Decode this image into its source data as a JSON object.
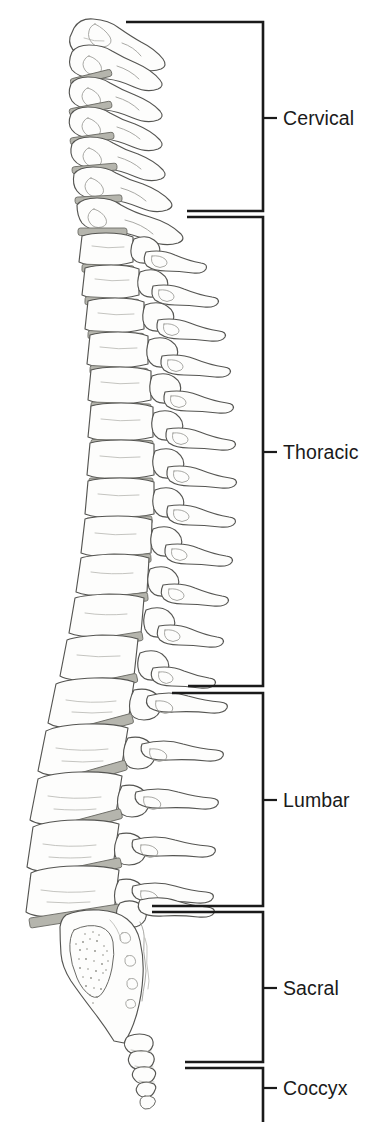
{
  "figure": {
    "view": "lateral",
    "background_color": "#ffffff",
    "line_color": "#3a3a3a",
    "bone_fill": "#fdfdfc",
    "disc_color": "#b5b5ad",
    "bracket_color": "#1a1a1a",
    "label_color": "#1a1a1a"
  },
  "brackets": {
    "spine_x": 263,
    "tick_length": 14,
    "label_x": 283,
    "regions": [
      {
        "id": "cervical",
        "label": "Cervical",
        "top_y": 22,
        "bottom_y": 211,
        "tick_y": 118,
        "arm_left_top_x": 126,
        "arm_left_bottom_x": 187,
        "vertebra_count": 7
      },
      {
        "id": "thoracic",
        "label": "Thoracic",
        "top_y": 217,
        "bottom_y": 686,
        "tick_y": 452,
        "arm_left_top_x": 187,
        "arm_left_bottom_x": 188,
        "vertebra_count": 12
      },
      {
        "id": "lumbar",
        "label": "Lumbar",
        "top_y": 693,
        "bottom_y": 906,
        "tick_y": 800,
        "arm_left_top_x": 172,
        "arm_left_bottom_x": 152,
        "vertebra_count": 5
      },
      {
        "id": "sacral",
        "label": "Sacral",
        "top_y": 912,
        "bottom_y": 1062,
        "tick_y": 988,
        "arm_left_top_x": 152,
        "arm_left_bottom_x": 185,
        "vertebra_count": 5
      },
      {
        "id": "coccyx",
        "label": "Coccyx",
        "top_y": 1068,
        "bottom_y": 1122,
        "tick_y": 1088,
        "arm_left_top_x": 185,
        "arm_left_bottom_x": 185,
        "vertebra_count": 4
      }
    ]
  },
  "spine": {
    "cervical_vertebrae": [
      {
        "cx": 100,
        "cy": 40,
        "w": 46,
        "h": 30,
        "rot": -24,
        "sp_len": 62,
        "sp_angle": 12
      },
      {
        "cx": 97,
        "cy": 72,
        "w": 44,
        "h": 26,
        "rot": -20,
        "sp_len": 66,
        "sp_angle": 16
      },
      {
        "cx": 95,
        "cy": 101,
        "w": 44,
        "h": 25,
        "rot": -16,
        "sp_len": 68,
        "sp_angle": 16
      },
      {
        "cx": 95,
        "cy": 129,
        "w": 45,
        "h": 25,
        "rot": -12,
        "sp_len": 66,
        "sp_angle": 14
      },
      {
        "cx": 97,
        "cy": 157,
        "w": 46,
        "h": 25,
        "rot": -8,
        "sp_len": 68,
        "sp_angle": 12
      },
      {
        "cx": 101,
        "cy": 185,
        "w": 48,
        "h": 26,
        "rot": -4,
        "sp_len": 76,
        "sp_angle": 10
      },
      {
        "cx": 107,
        "cy": 214,
        "w": 50,
        "h": 27,
        "rot": 0,
        "sp_len": 82,
        "sp_angle": 10
      }
    ],
    "thoracic_vertebrae": [
      {
        "cx": 113,
        "cy": 245,
        "w": 52,
        "h": 29,
        "rot": 3,
        "sp_len": 86,
        "sp_angle": 22
      },
      {
        "cx": 117,
        "cy": 277,
        "w": 54,
        "h": 30,
        "rot": 5,
        "sp_len": 90,
        "sp_angle": 25
      },
      {
        "cx": 121,
        "cy": 310,
        "w": 56,
        "h": 31,
        "rot": 6,
        "sp_len": 92,
        "sp_angle": 27
      },
      {
        "cx": 124,
        "cy": 344,
        "w": 58,
        "h": 32,
        "rot": 6,
        "sp_len": 92,
        "sp_angle": 28
      },
      {
        "cx": 126,
        "cy": 379,
        "w": 60,
        "h": 33,
        "rot": 5,
        "sp_len": 94,
        "sp_angle": 29
      },
      {
        "cx": 127,
        "cy": 414,
        "w": 62,
        "h": 34,
        "rot": 3,
        "sp_len": 96,
        "sp_angle": 30
      },
      {
        "cx": 126,
        "cy": 450,
        "w": 64,
        "h": 35,
        "rot": 1,
        "sp_len": 96,
        "sp_angle": 30
      },
      {
        "cx": 124,
        "cy": 487,
        "w": 66,
        "h": 36,
        "rot": -2,
        "sp_len": 94,
        "sp_angle": 29
      },
      {
        "cx": 120,
        "cy": 524,
        "w": 68,
        "h": 37,
        "rot": -5,
        "sp_len": 92,
        "sp_angle": 27
      },
      {
        "cx": 115,
        "cy": 562,
        "w": 70,
        "h": 38,
        "rot": -8,
        "sp_len": 90,
        "sp_angle": 24
      },
      {
        "cx": 108,
        "cy": 601,
        "w": 72,
        "h": 39,
        "rot": -11,
        "sp_len": 88,
        "sp_angle": 20
      },
      {
        "cx": 100,
        "cy": 641,
        "w": 76,
        "h": 41,
        "rot": -14,
        "sp_len": 86,
        "sp_angle": 14
      }
    ],
    "lumbar_vertebrae": [
      {
        "cx": 90,
        "cy": 686,
        "w": 84,
        "h": 45,
        "rot": -17,
        "sp_len": 92,
        "sp_angle": 4
      },
      {
        "cx": 81,
        "cy": 733,
        "w": 88,
        "h": 46,
        "rot": -18,
        "sp_len": 94,
        "sp_angle": 2
      },
      {
        "cx": 74,
        "cy": 781,
        "w": 90,
        "h": 46,
        "rot": -17,
        "sp_len": 94,
        "sp_angle": 0
      },
      {
        "cx": 70,
        "cy": 828,
        "w": 92,
        "h": 45,
        "rot": -14,
        "sp_len": 92,
        "sp_angle": -2
      },
      {
        "cx": 70,
        "cy": 874,
        "w": 94,
        "h": 44,
        "rot": -10,
        "sp_len": 90,
        "sp_angle": -5
      }
    ],
    "sacrum": {
      "top_x": 78,
      "top_y": 915,
      "bottom_x": 150,
      "bottom_y": 1042,
      "width": 78,
      "has_stipple": true
    },
    "coccyx_segments": [
      {
        "cx": 155,
        "cy": 1053,
        "w": 22,
        "h": 16
      },
      {
        "cx": 158,
        "cy": 1070,
        "w": 20,
        "h": 14
      },
      {
        "cx": 160,
        "cy": 1085,
        "w": 17,
        "h": 12
      },
      {
        "cx": 160,
        "cy": 1099,
        "w": 13,
        "h": 11
      }
    ]
  }
}
